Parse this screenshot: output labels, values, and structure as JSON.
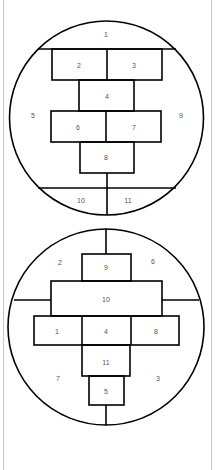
{
  "diagram": {
    "colors": {
      "stroke": "#000000",
      "label": "#555555",
      "background": "#ffffff",
      "frame": "#c8c8c8"
    },
    "circle_top": {
      "labels": {
        "r1": "1",
        "r2": "2",
        "r3": "3",
        "r4": "4",
        "r5": "5",
        "r6": "6",
        "r7": "7",
        "r8": "8",
        "r9": "9",
        "r10": "10",
        "r11": "11"
      }
    },
    "circle_bottom": {
      "labels": {
        "r1": "1",
        "r2": "2",
        "r3": "3",
        "r4": "4",
        "r5": "5",
        "r6": "6",
        "r7": "7",
        "r8": "8",
        "r9": "9",
        "r10": "10",
        "r11": "11"
      }
    }
  }
}
